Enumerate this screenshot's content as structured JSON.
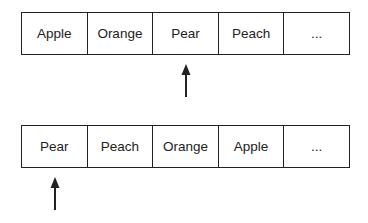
{
  "diagram": {
    "rows": [
      {
        "cells": [
          "Apple",
          "Orange",
          "Pear",
          "Peach",
          "..."
        ],
        "pointer_index": 2
      },
      {
        "cells": [
          "Pear",
          "Peach",
          "Orange",
          "Apple",
          "..."
        ],
        "pointer_index": 0
      }
    ],
    "colors": {
      "line": "#222222",
      "background": "#ffffff"
    }
  }
}
